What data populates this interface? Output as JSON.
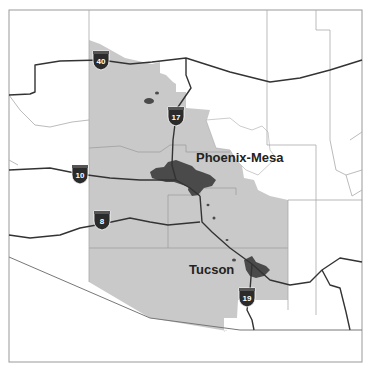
{
  "map": {
    "colors": {
      "background": "#ffffff",
      "frame": "#999999",
      "region_fill": "#c9c9c9",
      "urban_fill": "#4a4a4a",
      "highway": "#333333",
      "boundary": "#aaaaaa",
      "shield_fill": "#2b2b2b",
      "shield_top": "#555555"
    },
    "cities": [
      {
        "name": "Phoenix-Mesa",
        "x": 196,
        "y": 162
      },
      {
        "name": "Tucson",
        "x": 189,
        "y": 274
      }
    ],
    "shields": [
      {
        "route": "40",
        "x": 101,
        "y": 60
      },
      {
        "route": "17",
        "x": 176,
        "y": 116
      },
      {
        "route": "10",
        "x": 80,
        "y": 174
      },
      {
        "route": "8",
        "x": 102,
        "y": 220
      },
      {
        "route": "19",
        "x": 247,
        "y": 297
      }
    ]
  }
}
